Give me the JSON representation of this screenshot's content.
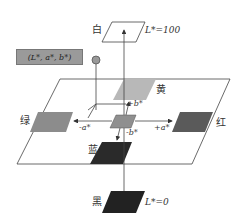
{
  "diagram": {
    "type": "CIELAB color space schematic",
    "coordinate_label": "(L*, a*, b*)",
    "white": {
      "label": "白",
      "value_label": "L*=100"
    },
    "black": {
      "label": "黑",
      "value_label": "L*=0"
    },
    "colors": [
      {
        "name": "黄",
        "meaning": "yellow",
        "axis": "+b*",
        "fill": "#b8b8b8"
      },
      {
        "name": "蓝",
        "meaning": "blue",
        "axis": "-b*",
        "fill": "#2a2a2a"
      },
      {
        "name": "绿",
        "meaning": "green",
        "axis": "-a*",
        "fill": "#8c8c8c"
      },
      {
        "name": "红",
        "meaning": "red",
        "axis": "+a*",
        "fill": "#5a5a5a"
      }
    ],
    "axes": {
      "plus_a": "+a*",
      "minus_a": "-a*",
      "plus_b": "+b*",
      "minus_b": "-b*"
    },
    "center_fill": "#8f8f8f",
    "point_fill": "#999999"
  }
}
